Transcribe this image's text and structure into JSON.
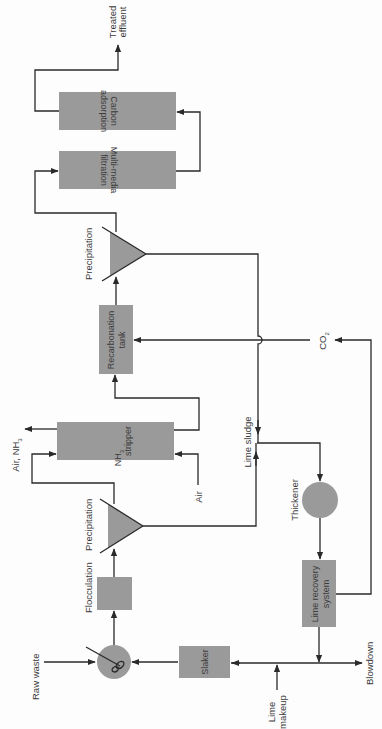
{
  "diagram": {
    "type": "process-flow",
    "orientation": "rotated-90-ccw",
    "colors": {
      "unit_fill": "#9a9a9a",
      "line": "#2a2a2a",
      "text": "#3a3a3a",
      "background": "#fdfdfd"
    },
    "units": {
      "mixer": {
        "label": ""
      },
      "flocculation": {
        "label": "Flocculation"
      },
      "precipitation_1": {
        "label": "Precipitation"
      },
      "nh3_stripper": {
        "line1_main": "NH",
        "line1_sub": "3",
        "line2": "stripper"
      },
      "recarbonation": {
        "line1": "Recarbonation",
        "line2": "tank"
      },
      "precipitation_2": {
        "label": "Precipitation"
      },
      "multimedia": {
        "line1": "Multi-media",
        "line2": "filtration"
      },
      "carbon": {
        "line1": "Carbon",
        "line2": "adsorption"
      },
      "slaker": {
        "label": "Slaker"
      },
      "thickener": {
        "label": "Thickener"
      },
      "lime_recovery": {
        "line1": "Lime recovery",
        "line2": "system"
      }
    },
    "streams": {
      "raw_waste": "Raw waste",
      "air_in": "Air",
      "air_nh3_out_main": "Air, NH",
      "air_nh3_out_sub": "3",
      "lime_sludge": "Lime sludge",
      "co2_main": "CO",
      "co2_sub": "2",
      "treated_line1": "Treated",
      "treated_line2": "effluent",
      "lime_makeup_line1": "Lime",
      "lime_makeup_line2": "makeup",
      "blowdown": "Blowdown"
    }
  }
}
